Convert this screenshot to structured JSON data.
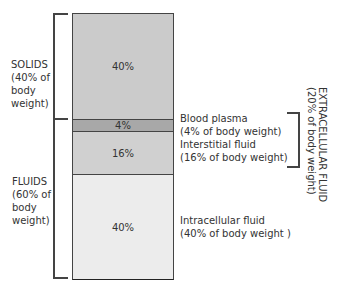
{
  "diagram": {
    "type": "stacked-bar",
    "segments": [
      {
        "id": "solids",
        "value_label": "40%",
        "color": "#cbcbcb"
      },
      {
        "id": "blood_plasma",
        "value_label": "4%",
        "color": "#a8a8a8"
      },
      {
        "id": "interstitial_fluid",
        "value_label": "16%",
        "color": "#d0d0d0"
      },
      {
        "id": "intracellular_fluid",
        "value_label": "40%",
        "color": "#ececec"
      }
    ],
    "left_labels": {
      "solids": [
        "SOLIDS",
        "(40% of",
        "body",
        "weight)"
      ],
      "fluids": [
        "FLUIDS",
        "(60% of",
        "body",
        "weight)"
      ]
    },
    "right_labels": {
      "blood_plasma": [
        "Blood plasma",
        "(4% of body weight)"
      ],
      "interstitial_fluid": [
        "Interstitial fluid",
        "(16% of body weight)"
      ],
      "intracellular_fluid": [
        "Intracellular fluid",
        "(40% of body weight )"
      ]
    },
    "extracellular_label": [
      "EXTRACELLULAR FLUID",
      "(20% of body weight)"
    ]
  }
}
